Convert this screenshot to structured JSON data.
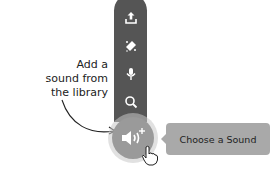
{
  "toolbar": {
    "items": [
      {
        "icon": "upload-icon",
        "label": "Upload Sound"
      },
      {
        "icon": "surprise-icon",
        "label": "Surprise"
      },
      {
        "icon": "microphone-icon",
        "label": "Record"
      },
      {
        "icon": "search-icon",
        "label": "Choose a Sound"
      }
    ],
    "main_button": {
      "icon": "sound-add-icon"
    }
  },
  "tooltip": {
    "text": "Choose a Sound"
  },
  "annotation": {
    "lines": [
      "Add a",
      "sound from",
      "the library"
    ]
  },
  "colors": {
    "column": "#555555",
    "main_button": "#9a9a9a",
    "tooltip": "#a9a9a9"
  }
}
